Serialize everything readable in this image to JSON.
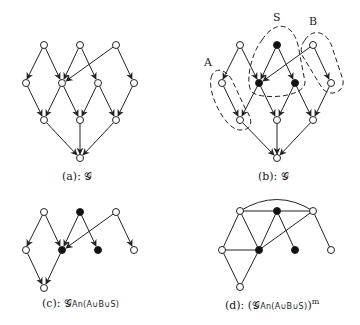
{
  "figure": {
    "panels": [
      {
        "id": "a",
        "caption_prefix": "(a): ",
        "caption_main": "𝒢"
      },
      {
        "id": "b",
        "caption_prefix": "(b): ",
        "caption_main": "𝒢",
        "set_labels": {
          "A": "A",
          "S": "S",
          "B": "B"
        }
      },
      {
        "id": "c",
        "caption_prefix": "(c): ",
        "caption_main": "𝒢",
        "caption_sub": "An(A∪B∪S)"
      },
      {
        "id": "d",
        "caption_prefix": "(d): ",
        "caption_open": "(",
        "caption_main": "𝒢",
        "caption_sub": "An(A∪B∪S)",
        "caption_close": ")",
        "caption_sup": "m"
      }
    ]
  }
}
